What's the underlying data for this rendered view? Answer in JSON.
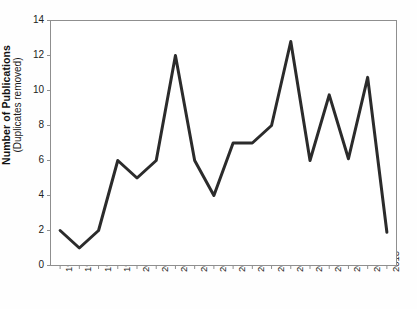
{
  "chart_data": {
    "type": "line",
    "title": "",
    "xlabel": "",
    "ylabel": "Number of Publications (Duplicates removed)",
    "ylabel_main": "Number of Publications",
    "ylabel_sub": "(Duplicates removed)",
    "categories": [
      "1996",
      "1997",
      "1998",
      "1999",
      "2000",
      "2001",
      "2002",
      "2003",
      "2004",
      "2005",
      "2006",
      "2007",
      "2008",
      "2009",
      "2010",
      "2011",
      "2012",
      "2013"
    ],
    "values": [
      2,
      1,
      2,
      6,
      5,
      6,
      12,
      6,
      4,
      7,
      7,
      8,
      12.8,
      6,
      9.75,
      6.1,
      10.75,
      1.9
    ],
    "series": [
      {
        "name": "Number of Publications",
        "values": [
          2,
          1,
          2,
          6,
          5,
          6,
          12,
          6,
          4,
          7,
          7,
          8,
          12.8,
          6,
          9.75,
          6.1,
          10.75,
          1.9
        ]
      }
    ],
    "ylim": [
      0,
      14
    ],
    "ytick_values": [
      0,
      2,
      4,
      6,
      8,
      10,
      12,
      14
    ],
    "ytick_labels": [
      "0",
      "2",
      "4",
      "6",
      "8",
      "10",
      "12",
      "14"
    ],
    "xlim_categories": 18,
    "grid": false,
    "legend": null,
    "legend_position": "none",
    "line_color": "#2b2b2b",
    "line_width": 3,
    "axis_color": "#8a8a8a",
    "background_color": "#ffffff",
    "x_tick_rotation": 90,
    "markers": false
  }
}
